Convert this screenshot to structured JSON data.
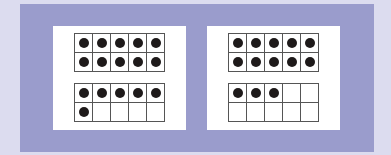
{
  "colors": {
    "frame": "#9a9ccc",
    "background": "#dcdcef",
    "panel": "#ffffff",
    "dot": "#1e1a1a",
    "grid": "#555555"
  },
  "panels": [
    {
      "name": "left",
      "total": 16,
      "frames": [
        {
          "name": "top",
          "filled": 10,
          "cells": 10
        },
        {
          "name": "bottom",
          "filled": 6,
          "cells": 10
        }
      ]
    },
    {
      "name": "right",
      "total": 13,
      "frames": [
        {
          "name": "top",
          "filled": 10,
          "cells": 10
        },
        {
          "name": "bottom",
          "filled": 3,
          "cells": 10
        }
      ]
    }
  ]
}
